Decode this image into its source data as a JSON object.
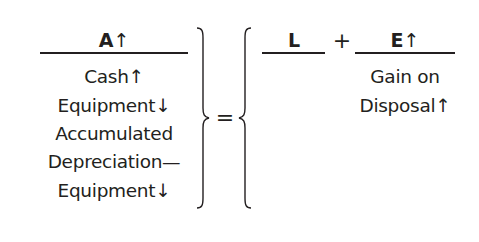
{
  "equation": {
    "assets": {
      "letter": "A",
      "arrow": "↑",
      "items": [
        "Cash↑",
        "Equipment↓",
        "Accumulated",
        "Depreciation—",
        "Equipment↓"
      ]
    },
    "equals": "=",
    "liabilities": {
      "letter": "L",
      "arrow": "",
      "items": []
    },
    "plus": "+",
    "equity": {
      "letter": "E",
      "arrow": "↑",
      "items": [
        "Gain on",
        "Disposal↑"
      ]
    }
  },
  "colors": {
    "ink": "#231f20",
    "background": "#ffffff"
  }
}
